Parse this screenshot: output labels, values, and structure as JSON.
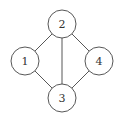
{
  "diagram": {
    "type": "undirected-graph",
    "nodes": [
      {
        "id": "1",
        "label": "1",
        "x": 25,
        "y": 61
      },
      {
        "id": "2",
        "label": "2",
        "x": 62,
        "y": 24
      },
      {
        "id": "3",
        "label": "3",
        "x": 62,
        "y": 98
      },
      {
        "id": "4",
        "label": "4",
        "x": 99,
        "y": 61
      }
    ],
    "edges": [
      [
        "1",
        "2"
      ],
      [
        "2",
        "3"
      ],
      [
        "2",
        "4"
      ],
      [
        "1",
        "3"
      ],
      [
        "4",
        "3"
      ]
    ],
    "node_radius": 14,
    "colors": {
      "stroke": "#444444",
      "fill": "#ffffff",
      "text": "#333333"
    }
  }
}
